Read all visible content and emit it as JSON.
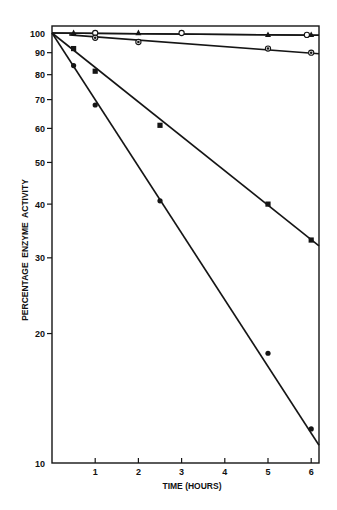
{
  "chart_data": {
    "type": "line",
    "title": "",
    "xlabel": "TIME (HOURS)",
    "ylabel": "PERCENTAGE  ENZYME  ACTIVITY",
    "yscale": "log",
    "xlim": [
      0,
      6.2
    ],
    "ylim": [
      10,
      100
    ],
    "x_ticks": [
      1,
      2,
      3,
      4,
      5,
      6
    ],
    "x_tick_labels": [
      "1",
      "2",
      "3",
      "4",
      "5",
      "6"
    ],
    "y_ticks": [
      10,
      20,
      30,
      40,
      50,
      60,
      70,
      80,
      90,
      100
    ],
    "y_tick_labels": [
      "10",
      "20",
      "30",
      "40",
      "50",
      "60",
      "70",
      "80",
      "90",
      "100"
    ],
    "grid": false,
    "legend": null,
    "series": [
      {
        "name": "open circles",
        "marker": "open-circle",
        "x": [
          1,
          3,
          5.9
        ],
        "y": [
          100,
          100,
          99
        ],
        "fit": {
          "x": [
            0,
            6.2
          ],
          "y": [
            100,
            98.8
          ]
        }
      },
      {
        "name": "triangles",
        "marker": "triangle",
        "x": [
          0.5,
          2,
          5,
          6
        ],
        "y": [
          100,
          100,
          99,
          99
        ],
        "fit": {
          "x": [
            0,
            6.2
          ],
          "y": [
            100,
            98.8
          ]
        }
      },
      {
        "name": "half-filled circles",
        "marker": "dotted-circle",
        "x": [
          1,
          2,
          5,
          6
        ],
        "y": [
          97.5,
          95.3,
          92,
          90
        ],
        "fit": {
          "x": [
            0.4,
            6.2
          ],
          "y": [
            99,
            89.5
          ]
        }
      },
      {
        "name": "filled squares",
        "marker": "square",
        "x": [
          0.5,
          1,
          2.5,
          5,
          6
        ],
        "y": [
          92,
          81.5,
          61,
          40,
          33
        ],
        "fit": {
          "x": [
            0,
            6.2
          ],
          "y": [
            100,
            32
          ]
        }
      },
      {
        "name": "filled circles",
        "marker": "filled-circle",
        "x": [
          0.5,
          1,
          2.5,
          5,
          6
        ],
        "y": [
          84,
          68,
          40.7,
          18,
          12
        ],
        "fit": {
          "x": [
            0,
            6.2
          ],
          "y": [
            100,
            11
          ]
        }
      }
    ]
  }
}
